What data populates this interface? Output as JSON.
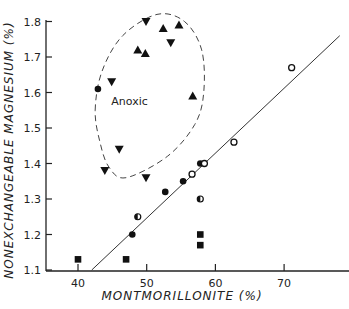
{
  "chart_data": {
    "type": "scatter",
    "title": "",
    "xlabel": "MONTMORILLONITE (%)",
    "ylabel": "NONEXCHANGEABLE MAGNESIUM (%)",
    "xlim": [
      36,
      80
    ],
    "ylim": [
      1.1,
      1.82
    ],
    "xticks": [
      40,
      50,
      60,
      70
    ],
    "yticks": [
      1.1,
      1.2,
      1.3,
      1.4,
      1.5,
      1.6,
      1.7,
      1.8
    ],
    "xtick_labels": [
      "40",
      "50",
      "60",
      "70"
    ],
    "ytick_labels": [
      "1.1",
      "1.2",
      "1.3",
      "1.4",
      "1.5",
      "1.6",
      "1.7",
      "1.8"
    ],
    "grid": false,
    "series": [
      {
        "name": "filled-circle",
        "marker": "circle-filled",
        "points": [
          [
            42.9,
            1.61
          ],
          [
            47.9,
            1.2
          ],
          [
            52.7,
            1.32
          ],
          [
            55.3,
            1.35
          ],
          [
            57.8,
            1.4
          ]
        ]
      },
      {
        "name": "open-circle",
        "marker": "circle-open",
        "points": [
          [
            56.6,
            1.37
          ],
          [
            58.4,
            1.4
          ],
          [
            62.7,
            1.46
          ],
          [
            71.1,
            1.67
          ]
        ]
      },
      {
        "name": "half-filled-circle",
        "marker": "circle-half",
        "points": [
          [
            48.7,
            1.25
          ],
          [
            57.8,
            1.3
          ]
        ]
      },
      {
        "name": "triangle-up",
        "marker": "triangle-up",
        "points": [
          [
            48.7,
            1.72
          ],
          [
            49.8,
            1.71
          ],
          [
            52.4,
            1.78
          ],
          [
            54.7,
            1.79
          ],
          [
            56.7,
            1.59
          ]
        ]
      },
      {
        "name": "triangle-down",
        "marker": "triangle-down",
        "points": [
          [
            44.9,
            1.63
          ],
          [
            49.9,
            1.8
          ],
          [
            53.5,
            1.74
          ],
          [
            46.0,
            1.44
          ],
          [
            43.9,
            1.38
          ],
          [
            49.9,
            1.36
          ]
        ]
      },
      {
        "name": "square",
        "marker": "square",
        "points": [
          [
            40.0,
            1.13
          ],
          [
            47.0,
            1.13
          ],
          [
            57.8,
            1.2
          ],
          [
            57.8,
            1.17
          ]
        ]
      }
    ],
    "regression_line": {
      "x": [
        42.0,
        78.1
      ],
      "y": [
        1.1,
        1.76
      ]
    },
    "annotations": [
      {
        "text": "Anoxic",
        "x": 47.5,
        "y": 1.565
      }
    ],
    "region": {
      "label": "Anoxic",
      "style": "dashed",
      "outline": [
        [
          42.5,
          1.55
        ],
        [
          43.5,
          1.66
        ],
        [
          46.5,
          1.76
        ],
        [
          51.5,
          1.82
        ],
        [
          55.5,
          1.8
        ],
        [
          58.0,
          1.72
        ],
        [
          58.3,
          1.6
        ],
        [
          57.0,
          1.51
        ],
        [
          53.0,
          1.42
        ],
        [
          47.0,
          1.36
        ],
        [
          44.5,
          1.39
        ],
        [
          43.2,
          1.46
        ]
      ]
    }
  }
}
